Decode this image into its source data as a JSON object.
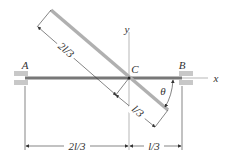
{
  "diagram": {
    "type": "mechanics-rotating-bar",
    "labels": {
      "point_a": "A",
      "point_b": "B",
      "point_c": "C",
      "axis_x": "x",
      "axis_y": "y",
      "angle": "θ"
    },
    "dimensions": {
      "inclined_upper": "2l/3",
      "inclined_lower": "l/3",
      "horizontal_left": "2l/3",
      "horizontal_right": "l/3"
    },
    "colors": {
      "horizontal_bar": "#777777",
      "inclined_bar": "#b0b0b0",
      "support_block": "#c8c8c8",
      "lines": "#333333",
      "axes": "#999999"
    }
  }
}
